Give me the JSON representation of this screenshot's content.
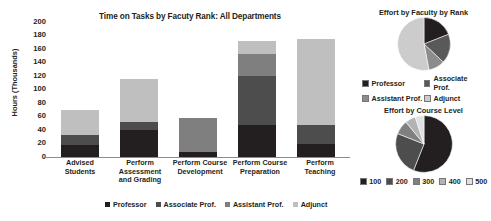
{
  "chart_data": [
    {
      "type": "bar",
      "subtype": "stacked-column",
      "title": "Time on Tasks by Facuty Rank: All Departments",
      "xlabel": "",
      "ylabel": "Hours (Thousands)",
      "ylim": [
        0,
        200
      ],
      "ytick_step": 20,
      "yticks": [
        200,
        180,
        160,
        140,
        120,
        100,
        80,
        60,
        40,
        20,
        0
      ],
      "grid": false,
      "legend_position": "bottom",
      "categories": [
        "Advised Students",
        "Perform Assessment and Grading",
        "Perform Course Development",
        "Perform Course Preparation",
        "Perform Teaching"
      ],
      "category_lines": [
        [
          "Advised",
          "Students"
        ],
        [
          "Perform",
          "Assessment",
          "and Grading"
        ],
        [
          "Perform Course",
          "Development"
        ],
        [
          "Perform Course",
          "Preparation"
        ],
        [
          "Perform",
          "Teaching"
        ]
      ],
      "series": [
        {
          "name": "Professor",
          "color": "#231f20",
          "values": [
            18,
            40,
            8,
            47,
            20
          ]
        },
        {
          "name": "Associate Prof.",
          "color": "#4d4d4d",
          "values": [
            15,
            12,
            0,
            73,
            28
          ]
        },
        {
          "name": "Assistant Prof.",
          "color": "#7f7f7f",
          "values": [
            0,
            0,
            50,
            32,
            0
          ]
        },
        {
          "name": "Adjunct",
          "color": "#bfbfbf",
          "values": [
            36,
            63,
            0,
            20,
            127
          ]
        }
      ],
      "totals": [
        69,
        115,
        58,
        172,
        175
      ]
    },
    {
      "type": "pie",
      "title": "Effort by Faculty by Rank",
      "legend_position": "bottom",
      "labels": [
        "Professor",
        "Associate Prof.",
        "Assistant Prof.",
        "Adjunct"
      ],
      "colors": [
        "#231f20",
        "#595959",
        "#8c8c8c",
        "#cccccc"
      ],
      "values": [
        19,
        18,
        10,
        53
      ]
    },
    {
      "type": "pie",
      "title": "Effort by Course Level",
      "legend_position": "bottom",
      "labels": [
        "100",
        "200",
        "300",
        "400",
        "500"
      ],
      "colors": [
        "#231f20",
        "#4d4d4d",
        "#808080",
        "#b3b3b3",
        "#e0e0e0"
      ],
      "values": [
        56,
        25,
        8,
        6,
        5
      ]
    }
  ],
  "bar_chart": {
    "title": "Time on Tasks by Facuty Rank: All Departments",
    "y_axis_title": "Hours (Thousands)",
    "y_ticks": [
      "200",
      "180",
      "160",
      "140",
      "120",
      "100",
      "80",
      "60",
      "40",
      "20",
      "0"
    ],
    "x_labels": [
      {
        "l1": "Advised",
        "l2": "Students",
        "l3": ""
      },
      {
        "l1": "Perform",
        "l2": "Assessment",
        "l3": "and Grading"
      },
      {
        "l1": "Perform Course",
        "l2": "Development",
        "l3": ""
      },
      {
        "l1": "Perform Course",
        "l2": "Preparation",
        "l3": ""
      },
      {
        "l1": "Perform",
        "l2": "Teaching",
        "l3": ""
      }
    ],
    "legend": [
      {
        "label": "Professor",
        "color": "#231f20"
      },
      {
        "label": "Associate Prof.",
        "color": "#4d4d4d"
      },
      {
        "label": "Assistant Prof.",
        "color": "#7f7f7f"
      },
      {
        "label": "Adjunct",
        "color": "#bfbfbf"
      }
    ]
  },
  "pie_rank": {
    "title": "Effort by Faculty by Rank",
    "legend": [
      {
        "label": "Professor",
        "color": "#231f20"
      },
      {
        "label": "Associate Prof.",
        "color": "#595959"
      },
      {
        "label": "Assistant Prof.",
        "color": "#8c8c8c"
      },
      {
        "label": "Adjunct",
        "color": "#cccccc"
      }
    ]
  },
  "pie_course": {
    "title": "Effort by Course Level",
    "legend": [
      {
        "label": "100",
        "color": "#231f20"
      },
      {
        "label": "200",
        "color": "#4d4d4d"
      },
      {
        "label": "300",
        "color": "#808080"
      },
      {
        "label": "400",
        "color": "#b3b3b3"
      },
      {
        "label": "500",
        "color": "#e0e0e0"
      }
    ]
  }
}
